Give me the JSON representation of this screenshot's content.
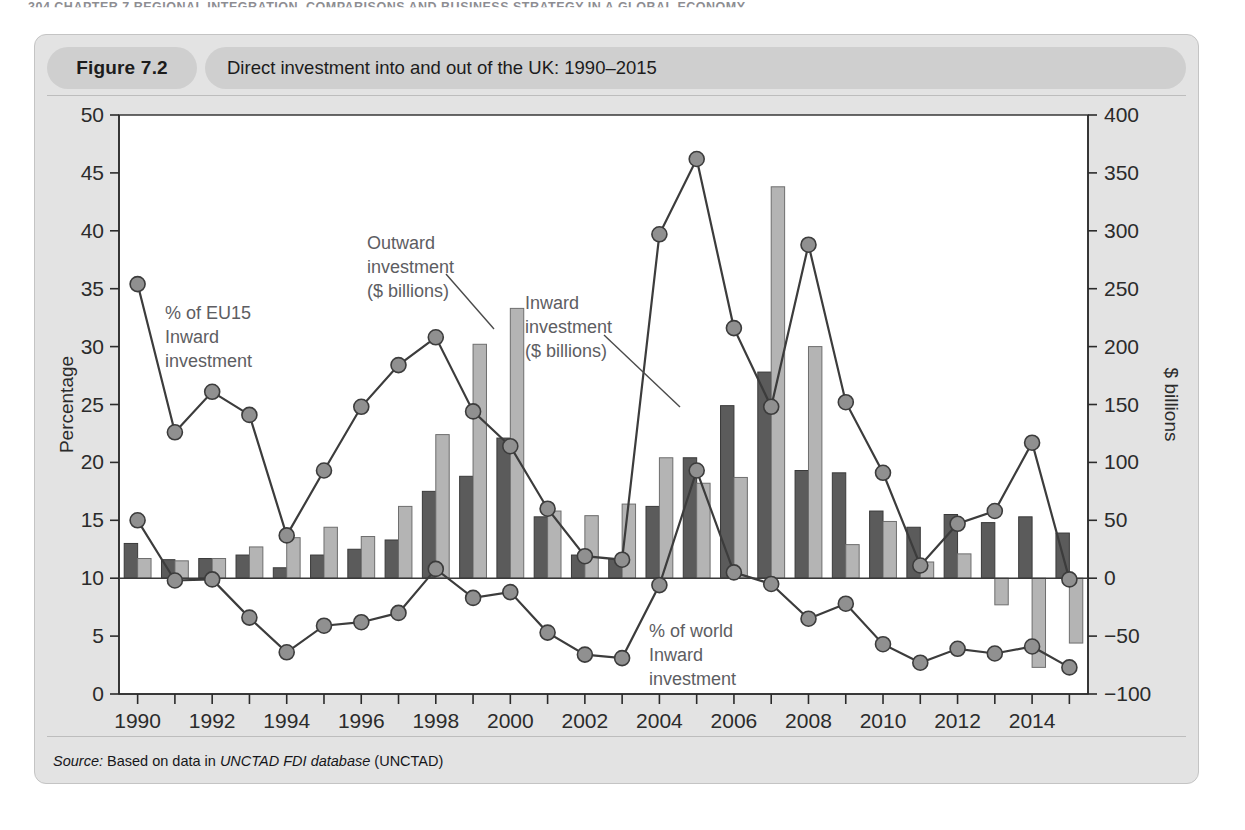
{
  "page_header": "304  CHAPTER 7  REGIONAL INTEGRATION, COMPARISONS AND BUSINESS STRATEGY IN A GLOBAL ECONOMY",
  "figure": {
    "number_label": "Figure 7.2",
    "title": "Direct investment into and out of the UK: 1990–2015",
    "source_prefix": "Source:",
    "source_text_1": " Based on data in ",
    "source_italic": "UNCTAD FDI database",
    "source_text_2": " (UNCTAD)"
  },
  "annotations": {
    "eu15": "% of EU15\nInward\ninvestment",
    "eu15_lines": [
      "% of EU15",
      "Inward",
      "investment"
    ],
    "outward": [
      "Outward",
      "investment",
      "($ billions)"
    ],
    "inward": [
      "Inward",
      "investment",
      "($ billions)"
    ],
    "world": [
      "% of world",
      "Inward",
      "investment"
    ]
  },
  "chart_data": {
    "type": "bar",
    "title": "Direct investment into and out of the UK: 1990–2015",
    "xlabel": "",
    "ylabel": "Percentage",
    "y2label": "$ billions",
    "ylim": [
      0,
      50
    ],
    "y2lim": [
      -100,
      400
    ],
    "ytick_step": 5,
    "y2tick_step": 50,
    "grid": false,
    "legend": "inline-annotations",
    "categories": [
      1990,
      1991,
      1992,
      1993,
      1994,
      1995,
      1996,
      1997,
      1998,
      1999,
      2000,
      2001,
      2002,
      2003,
      2004,
      2005,
      2006,
      2007,
      2008,
      2009,
      2010,
      2011,
      2012,
      2013,
      2014,
      2015
    ],
    "xtick_labels": [
      "1990",
      "1992",
      "1994",
      "1996",
      "1998",
      "2000",
      "2002",
      "2004",
      "2006",
      "2008",
      "2010",
      "2012",
      "2014"
    ],
    "yticks": [
      0,
      5,
      10,
      15,
      20,
      25,
      30,
      35,
      40,
      45,
      50
    ],
    "y2ticks": [
      -100,
      -50,
      0,
      50,
      100,
      150,
      200,
      250,
      300,
      350,
      400
    ],
    "series": [
      {
        "name": "Inward investment ($ billions)",
        "type": "bar",
        "axis": "right",
        "units": "$ billions",
        "color": "#5b5b5b",
        "values": [
          30,
          16,
          17,
          20,
          9,
          20,
          25,
          33,
          75,
          88,
          121,
          53,
          20,
          17,
          62,
          104,
          149,
          178,
          93,
          91,
          58,
          44,
          55,
          48,
          53,
          39
        ]
      },
      {
        "name": "Outward investment ($ billions)",
        "type": "bar",
        "axis": "right",
        "units": "$ billions",
        "color": "#b4b4b4",
        "values": [
          17,
          15,
          17,
          27,
          35,
          44,
          36,
          62,
          124,
          202,
          233,
          58,
          54,
          64,
          104,
          82,
          87,
          338,
          200,
          29,
          49,
          14,
          21,
          -23,
          -77,
          -56
        ]
      },
      {
        "name": "% of EU15 Inward investment",
        "type": "line",
        "axis": "left",
        "units": "percent",
        "color": "#3c3c3c",
        "values": [
          35.4,
          22.6,
          26.1,
          24.1,
          13.7,
          19.3,
          24.8,
          28.4,
          30.8,
          24.4,
          21.4,
          16.0,
          11.9,
          11.6,
          39.7,
          46.2,
          31.6,
          24.8,
          38.8,
          25.2,
          19.1,
          11.1,
          14.7,
          15.8,
          21.7,
          9.9
        ]
      },
      {
        "name": "% of world Inward investment",
        "type": "line",
        "axis": "left",
        "units": "percent",
        "color": "#3c3c3c",
        "values": [
          15.0,
          9.8,
          9.9,
          6.6,
          3.6,
          5.9,
          6.2,
          7.0,
          10.8,
          8.3,
          8.8,
          5.3,
          3.4,
          3.1,
          9.4,
          19.3,
          10.5,
          9.5,
          6.5,
          7.8,
          4.3,
          2.7,
          3.9,
          3.5,
          4.1,
          2.3
        ]
      }
    ]
  }
}
